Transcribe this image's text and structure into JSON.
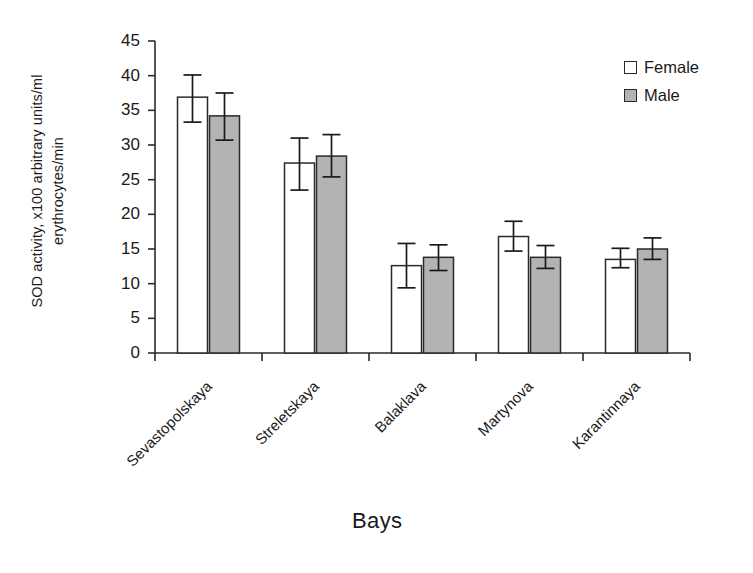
{
  "chart_data": {
    "type": "bar",
    "title": "",
    "xlabel": "Bays",
    "ylabel": "SOD activity, x100 arbitrary units/ml\nerythrocytes/min",
    "categories": [
      "Sevastopolskaya",
      "Streletskaya",
      "Balaklava",
      "Martynova",
      "Karantinnaya"
    ],
    "ylim": [
      0,
      45
    ],
    "ytick_values": [
      0,
      5,
      10,
      15,
      20,
      25,
      30,
      35,
      40,
      45
    ],
    "ytick_labels": [
      "0",
      "5",
      "10",
      "15",
      "20",
      "25",
      "30",
      "35",
      "40",
      "45"
    ],
    "grid": false,
    "legend_position": "top-right",
    "series": [
      {
        "name": "Female",
        "color": "#ffffff",
        "edge_color": "#2a2a2a",
        "values": [
          36.9,
          27.4,
          12.6,
          16.8,
          13.5
        ],
        "error_upper": [
          40.1,
          31.0,
          15.8,
          19.0,
          15.1
        ],
        "error_lower": [
          33.3,
          23.5,
          9.4,
          14.7,
          12.3
        ]
      },
      {
        "name": "Male",
        "color": "#b3b3b3",
        "edge_color": "#2a2a2a",
        "values": [
          34.2,
          28.4,
          13.8,
          13.8,
          15.0
        ],
        "error_upper": [
          37.5,
          31.5,
          15.6,
          15.5,
          16.6
        ],
        "error_lower": [
          30.7,
          25.4,
          11.9,
          12.2,
          13.5
        ]
      }
    ]
  },
  "legend": {
    "items": [
      {
        "label": "Female",
        "swatch": "open-square"
      },
      {
        "label": "Male",
        "swatch": "filled-square"
      }
    ]
  },
  "axes": {
    "x_title": "Bays",
    "y_title": "SOD activity, x100 arbitrary units/ml\nerythrocytes/min"
  }
}
